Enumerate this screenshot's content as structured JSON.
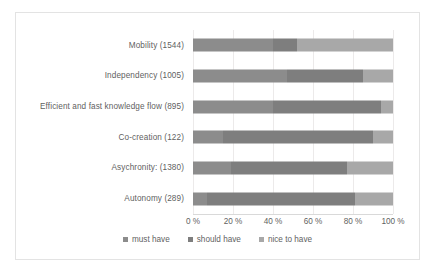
{
  "chart_data": {
    "type": "bar",
    "orientation": "horizontal",
    "stacked": true,
    "normalized_percent": true,
    "title": "",
    "subtitle": "",
    "xlabel": "",
    "ylabel": "",
    "xlim": [
      0,
      100
    ],
    "grid": true,
    "legend_position": "bottom",
    "categories": [
      "Mobility (1544)",
      "Independency (1005)",
      "Efficient and fast knowledge flow (895)",
      "Co-creation (122)",
      "Asychronity: (1380)",
      "Autonomy (289)"
    ],
    "tick_labels": [
      "0 %",
      "20 %",
      "40 %",
      "60 %",
      "80 %",
      "100 %"
    ],
    "tick_values": [
      0,
      20,
      40,
      60,
      80,
      100
    ],
    "series": [
      {
        "name": "must have",
        "color": "#8c8c8c",
        "values": [
          40,
          47,
          40,
          15,
          19,
          7
        ]
      },
      {
        "name": "should have",
        "color": "#7e7e7e",
        "values": [
          12,
          38,
          54,
          75,
          58,
          74
        ]
      },
      {
        "name": "nice to have",
        "color": "#a8a8a8",
        "values": [
          48,
          15,
          6,
          10,
          23,
          19
        ]
      }
    ]
  },
  "style": {
    "border_color": "#e3e3e3",
    "gridline_color": "#eceaea",
    "text_color": "#5f5f5f",
    "background": "#ffffff"
  }
}
